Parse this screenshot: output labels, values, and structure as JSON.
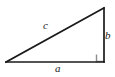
{
  "figure": {
    "type": "right-triangle-diagram",
    "background_color": "#ffffff",
    "stroke_color": "#1a1a1a",
    "stroke_width": 1.6,
    "right_angle_marker": {
      "name": "right-angle-marker",
      "color": "#8c8c8c",
      "size": 8,
      "at_vertex": "bottom-right"
    },
    "vertices": {
      "bottom_left": {
        "x": 6,
        "y": 62
      },
      "bottom_right": {
        "x": 104,
        "y": 62
      },
      "top_right": {
        "x": 104,
        "y": 8
      }
    },
    "labels": {
      "hypotenuse": "c",
      "vertical_leg": "b",
      "horizontal_leg": "a"
    }
  }
}
